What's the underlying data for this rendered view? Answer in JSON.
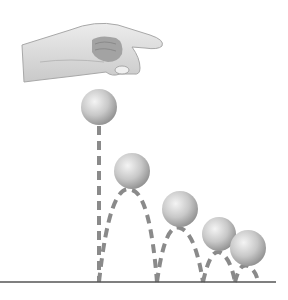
{
  "diagram": {
    "colors": {
      "background": "#ffffff",
      "ball_light": "#f2f2f2",
      "ball_mid": "#c6c6c6",
      "ball_dark": "#8e8e8e",
      "trajectory": "#8a8a8a",
      "ground": "#555555",
      "hand_light": "#e6e6e6",
      "hand_mid": "#cfcfcf",
      "hand_shadow": "#9a9a9a"
    },
    "hand": {
      "icon": "hand-releasing-icon"
    },
    "balls": [
      {
        "cx": 99,
        "cy": 107,
        "r": 18
      },
      {
        "cx": 132,
        "cy": 171,
        "r": 18
      },
      {
        "cx": 180,
        "cy": 209,
        "r": 18
      },
      {
        "cx": 219,
        "cy": 234,
        "r": 17
      },
      {
        "cx": 248,
        "cy": 248,
        "r": 18
      }
    ],
    "bounce_points_x": [
      99,
      157,
      203,
      235
    ],
    "ground": {
      "y": 282,
      "x1": 0,
      "x2": 276
    }
  }
}
